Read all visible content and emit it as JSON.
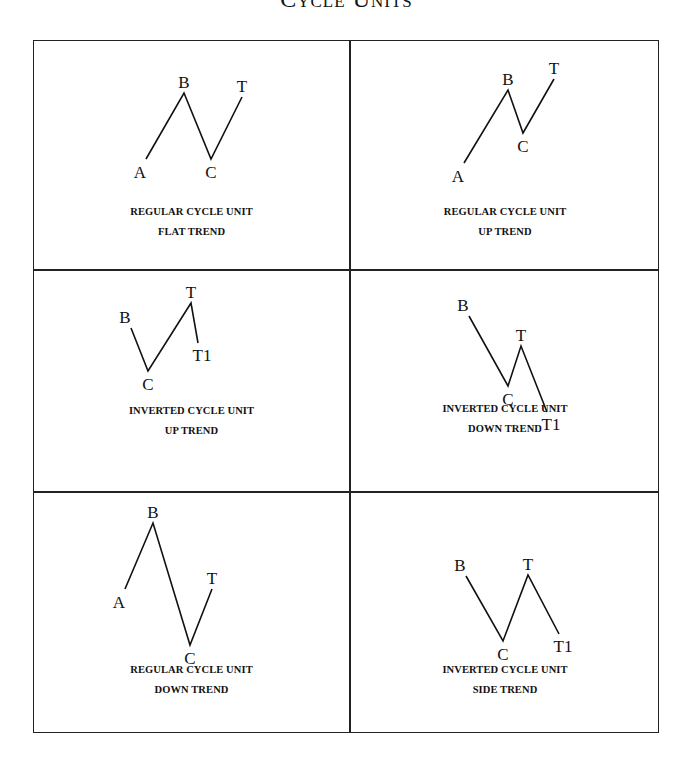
{
  "title": "Cycle Units",
  "panels": [
    {
      "caption_line1": "REGULAR CYCLE UNIT",
      "caption_line2": "FLAT TREND",
      "points": [
        {
          "label": "A",
          "x": 112,
          "y": 118
        },
        {
          "label": "B",
          "x": 150,
          "y": 52
        },
        {
          "label": "C",
          "x": 177,
          "y": 118
        },
        {
          "label": "T",
          "x": 208,
          "y": 56
        }
      ]
    },
    {
      "caption_line1": "REGULAR CYCLE UNIT",
      "caption_line2": "UP TREND",
      "points": [
        {
          "label": "A",
          "x": 114,
          "y": 122
        },
        {
          "label": "B",
          "x": 158,
          "y": 49
        },
        {
          "label": "C",
          "x": 173,
          "y": 92
        },
        {
          "label": "T",
          "x": 204,
          "y": 38
        }
      ]
    },
    {
      "caption_line1": "INVERTED CYCLE UNIT",
      "caption_line2": "UP TREND",
      "points": [
        {
          "label": "B",
          "x": 97,
          "y": 58
        },
        {
          "label": "C",
          "x": 114,
          "y": 101
        },
        {
          "label": "T",
          "x": 157,
          "y": 33
        },
        {
          "label": "T1",
          "x": 164,
          "y": 73
        }
      ]
    },
    {
      "caption_line1": "INVERTED CYCLE UNIT",
      "caption_line2": "DOWN TREND",
      "points": [
        {
          "label": "B",
          "x": 119,
          "y": 46
        },
        {
          "label": "C",
          "x": 158,
          "y": 116
        },
        {
          "label": "T",
          "x": 171,
          "y": 76
        },
        {
          "label": "T1",
          "x": 197,
          "y": 142
        }
      ]
    },
    {
      "caption_line1": "REGULAR CYCLE UNIT",
      "caption_line2": "DOWN TREND",
      "points": [
        {
          "label": "A",
          "x": 91,
          "y": 97
        },
        {
          "label": "B",
          "x": 119,
          "y": 31
        },
        {
          "label": "C",
          "x": 156,
          "y": 153
        },
        {
          "label": "T",
          "x": 178,
          "y": 97
        }
      ]
    },
    {
      "caption_line1": "INVERTED CYCLE UNIT",
      "caption_line2": "SIDE TREND",
      "points": [
        {
          "label": "B",
          "x": 116,
          "y": 84
        },
        {
          "label": "C",
          "x": 153,
          "y": 149
        },
        {
          "label": "T",
          "x": 178,
          "y": 83
        },
        {
          "label": "T1",
          "x": 209,
          "y": 142
        }
      ]
    }
  ]
}
